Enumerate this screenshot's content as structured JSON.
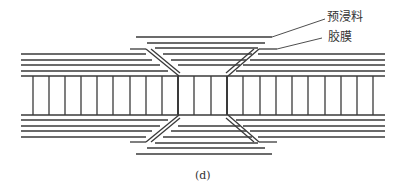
{
  "figure": {
    "caption": "(d)",
    "labels": {
      "prepreg": "预浸料",
      "adhesive_film": "胶膜"
    },
    "colors": {
      "line": "#3a3a3a",
      "background": "#ffffff"
    }
  }
}
